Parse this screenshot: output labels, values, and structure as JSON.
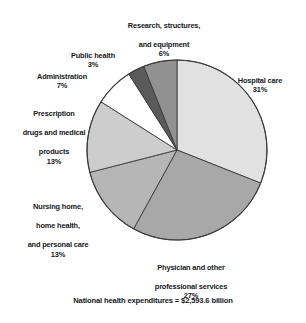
{
  "chart_data": {
    "type": "pie",
    "title": "",
    "subtitle": "",
    "footnote": "National health expenditures = $2,593.6 billion",
    "total_label": "National health expenditures",
    "total_value": "$2,593.6 billion",
    "legend_position": "callout-labels",
    "start_angle_deg": 0,
    "direction": "clockwise",
    "center": {
      "x": 177,
      "y": 150
    },
    "radius": 90,
    "categories": [
      "Hospital care",
      "Physician and other professional services",
      "Nursing home, home health, and personal care",
      "Prescription drugs and medical products",
      "Administration",
      "Public health",
      "Research, structures, and equipment"
    ],
    "values": [
      31,
      27,
      13,
      13,
      7,
      3,
      6
    ],
    "value_suffix": "%",
    "colors": [
      "#e1e1e1",
      "#a8a8a8",
      "#b6b6b6",
      "#cdcdcd",
      "#ffffff",
      "#5a5a5a",
      "#919191"
    ],
    "stroke": "#3a3a3a",
    "slices": [
      {
        "key": "hospital-care",
        "name": "Hospital care",
        "label_line1": "Hospital care",
        "percent_label": "31%",
        "value": 31,
        "color": "#e1e1e1",
        "start_deg": 0,
        "end_deg": 111.6
      },
      {
        "key": "physician-services",
        "name": "Physician and other professional services",
        "label_line1": "Physician and other",
        "label_line2": "professional services",
        "percent_label": "27%",
        "value": 27,
        "color": "#a8a8a8",
        "start_deg": 111.6,
        "end_deg": 208.8
      },
      {
        "key": "nursing-home",
        "name": "Nursing home, home health, and personal care",
        "label_line1": "Nursing home,",
        "label_line2": "home health,",
        "label_line3": "and personal care",
        "percent_label": "13%",
        "value": 13,
        "color": "#b6b6b6",
        "start_deg": 208.8,
        "end_deg": 255.6
      },
      {
        "key": "prescription-drugs",
        "name": "Prescription drugs and medical products",
        "label_line1": "Prescription",
        "label_line2": "drugs and medical",
        "label_line3": "products",
        "percent_label": "13%",
        "value": 13,
        "color": "#cdcdcd",
        "start_deg": 255.6,
        "end_deg": 302.4
      },
      {
        "key": "administration",
        "name": "Administration",
        "label_line1": "Administration",
        "percent_label": "7%",
        "value": 7,
        "color": "#ffffff",
        "start_deg": 302.4,
        "end_deg": 327.6
      },
      {
        "key": "public-health",
        "name": "Public health",
        "label_line1": "Public health",
        "percent_label": "3%",
        "value": 3,
        "color": "#5a5a5a",
        "start_deg": 327.6,
        "end_deg": 338.4
      },
      {
        "key": "research-structures-equipment",
        "name": "Research, structures, and equipment",
        "label_line1": "Research, structures,",
        "label_line2": "and equipment",
        "percent_label": "6%",
        "value": 6,
        "color": "#919191",
        "start_deg": 338.4,
        "end_deg": 360
      }
    ]
  },
  "labels": {
    "research": {
      "line1": "Research, structures,",
      "line2": "and equipment",
      "percent": "6%"
    },
    "public_health": {
      "line1": "Public health",
      "percent": "3%"
    },
    "administration": {
      "line1": "Administration",
      "percent": "7%"
    },
    "prescription": {
      "line1": "Prescription",
      "line2": "drugs and medical",
      "line3": "products",
      "percent": "13%"
    },
    "nursing": {
      "line1": "Nursing home,",
      "line2": "home health,",
      "line3": "and personal care",
      "percent": "13%"
    },
    "hospital": {
      "line1": "Hospital care",
      "percent": "31%"
    },
    "physician": {
      "line1": "Physician and other",
      "line2": "professional services",
      "percent": "27%"
    }
  },
  "footnote": "National health expenditures = $2,593.6 billion"
}
